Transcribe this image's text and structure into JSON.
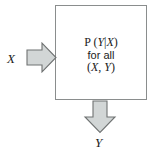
{
  "diagram": {
    "type": "block-diagram",
    "background_color": "#ffffff",
    "box": {
      "name": "process-box",
      "border_color": "#8a8d8d",
      "fill_color": "#ffffff",
      "text_lines": [
        {
          "id": "formula",
          "prefix": "P (",
          "target": "Y",
          "bar": "|",
          "given": "X",
          "suffix": ")",
          "full": "P (Y|X)"
        },
        {
          "id": "qualifier",
          "full": "for all"
        },
        {
          "id": "pair",
          "open": "(",
          "first": "X",
          "comma": ", ",
          "second": "Y",
          "close": ")",
          "full": "(X, Y)"
        }
      ]
    },
    "arrows": [
      {
        "name": "input-arrow",
        "direction": "right",
        "fill_color": "#d2d6d6",
        "stroke_color": "#6f7272",
        "label": "X"
      },
      {
        "name": "output-arrow",
        "direction": "down",
        "fill_color": "#d2d6d6",
        "stroke_color": "#6f7272",
        "label": "Y"
      }
    ],
    "labels": {
      "input": "X",
      "output": "Y"
    }
  }
}
